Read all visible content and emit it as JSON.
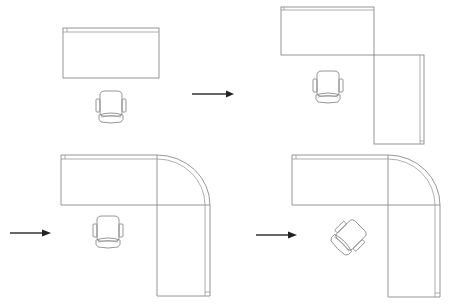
{
  "diagram": {
    "title": "Office workstation layout progression",
    "colors": {
      "line": "#8a8a8a",
      "arrow": "#222222",
      "background": "#ffffff"
    },
    "steps": [
      {
        "id": "step-1",
        "label": "Straight desk with chair",
        "elements": [
          "rectangular-desk",
          "office-chair"
        ]
      },
      {
        "id": "step-2",
        "label": "L-shaped desk (square corner) with chair",
        "elements": [
          "main-desk",
          "return-desk",
          "office-chair"
        ]
      },
      {
        "id": "step-3",
        "label": "L-shaped desk with curved corner and chair",
        "elements": [
          "main-desk",
          "curved-corner",
          "return-desk",
          "office-chair"
        ]
      },
      {
        "id": "step-4",
        "label": "L-shaped desk with curved corner and rotated chair",
        "elements": [
          "main-desk",
          "curved-corner",
          "return-desk",
          "rotated-office-chair"
        ]
      }
    ],
    "arrows": [
      {
        "id": "arrow-1",
        "from": "step-1",
        "to": "step-2",
        "icon": "right-arrow-icon"
      },
      {
        "id": "arrow-2",
        "from": "step-2",
        "to": "step-3",
        "icon": "right-arrow-icon"
      },
      {
        "id": "arrow-3",
        "from": "step-3",
        "to": "step-4",
        "icon": "right-arrow-icon"
      }
    ]
  }
}
